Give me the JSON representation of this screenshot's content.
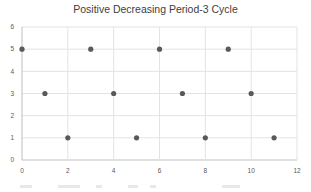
{
  "chart_data": {
    "type": "scatter",
    "title": "Positive Decreasing Period-3 Cycle",
    "xlabel": "",
    "ylabel": "",
    "xlim": [
      0,
      12
    ],
    "ylim": [
      0,
      6
    ],
    "x_ticks": [
      "0",
      "2",
      "4",
      "6",
      "8",
      "10",
      "12"
    ],
    "y_ticks": [
      "0",
      "1",
      "2",
      "3",
      "4",
      "5",
      "6"
    ],
    "grid": true,
    "legend": "none",
    "series": [
      {
        "name": "Series1",
        "x": [
          0,
          1,
          2,
          3,
          4,
          5,
          6,
          7,
          8,
          9,
          10,
          11
        ],
        "values": [
          5,
          3,
          1,
          5,
          3,
          1,
          5,
          3,
          1,
          5,
          3,
          1
        ],
        "color": "#595959"
      }
    ]
  }
}
